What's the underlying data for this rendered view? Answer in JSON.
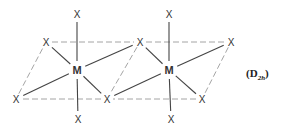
{
  "diagram": {
    "type": "molecular-structure",
    "symmetry_label": {
      "open": "(",
      "symbol": "D",
      "subscript": "2h",
      "close": ")"
    },
    "atoms": [
      {
        "id": "X1",
        "label": "X",
        "x": 77,
        "y": 14
      },
      {
        "id": "M1",
        "label": "M",
        "x": 77,
        "y": 70
      },
      {
        "id": "X2",
        "label": "X",
        "x": 78,
        "y": 119
      },
      {
        "id": "X3",
        "label": "X",
        "x": 46,
        "y": 42
      },
      {
        "id": "X4",
        "label": "X",
        "x": 140,
        "y": 42
      },
      {
        "id": "X5",
        "label": "X",
        "x": 16,
        "y": 99
      },
      {
        "id": "X6",
        "label": "X",
        "x": 107,
        "y": 99
      },
      {
        "id": "X7",
        "label": "X",
        "x": 169,
        "y": 14
      },
      {
        "id": "M2",
        "label": "M",
        "x": 169,
        "y": 70
      },
      {
        "id": "X8",
        "label": "X",
        "x": 171,
        "y": 119
      },
      {
        "id": "X9",
        "label": "X",
        "x": 231,
        "y": 42
      },
      {
        "id": "X10",
        "label": "X",
        "x": 202,
        "y": 99
      }
    ],
    "bonds": [
      [
        "M1",
        "X1"
      ],
      [
        "M1",
        "X2"
      ],
      [
        "M1",
        "X3"
      ],
      [
        "M1",
        "X4"
      ],
      [
        "M1",
        "X5"
      ],
      [
        "M1",
        "X6"
      ],
      [
        "M2",
        "X7"
      ],
      [
        "M2",
        "X8"
      ],
      [
        "M2",
        "X4"
      ],
      [
        "M2",
        "X9"
      ],
      [
        "M2",
        "X6"
      ],
      [
        "M2",
        "X10"
      ]
    ],
    "dashed_edges": [
      [
        "X3",
        "X4"
      ],
      [
        "X4",
        "X6"
      ],
      [
        "X6",
        "X5"
      ],
      [
        "X5",
        "X3"
      ],
      [
        "X4",
        "X9"
      ],
      [
        "X9",
        "X10"
      ],
      [
        "X10",
        "X6"
      ]
    ],
    "colors": {
      "bond": "#444444",
      "dashed_edge": "#9a9a9a",
      "text": "#333333",
      "background": "#ffffff"
    }
  }
}
